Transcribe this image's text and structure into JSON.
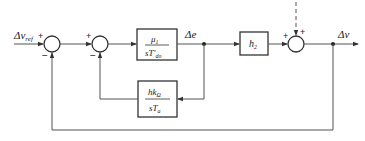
{
  "diagram": {
    "input_label": "Δv",
    "input_sub": "ref",
    "output_label": "Δv",
    "mid_signal_label": "Δe",
    "sum1": {
      "top_sign": "+",
      "bottom_sign": "−"
    },
    "sum2": {
      "top_sign": "+",
      "bottom_sign": "−"
    },
    "sum3": {
      "left_sign": "+",
      "top_sign": "+"
    },
    "block1": {
      "num": "μ",
      "num_sub": "1",
      "den": "sT'",
      "den_sub": "do"
    },
    "block2": {
      "num": "hk",
      "num_sub": "Ω",
      "den": "sT",
      "den_sub": "a"
    },
    "block3": {
      "label": "h",
      "label_sub": "2"
    },
    "colors": {
      "line": "#555555",
      "box": "#333333"
    }
  }
}
